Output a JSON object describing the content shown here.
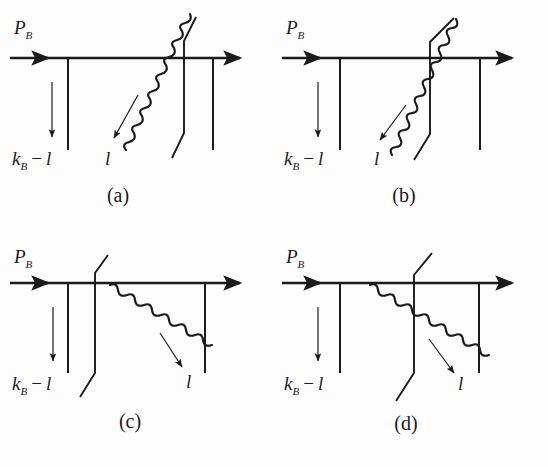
{
  "figure": {
    "type": "feynman-diagram-set",
    "background_color": "#fdfdfd",
    "ink_color": "#1b1b1b",
    "panel_count": 4
  },
  "labels": {
    "incoming_momentum": "P",
    "incoming_momentum_sub": "B",
    "spectator_momentum": "k",
    "spectator_momentum_sub": "B",
    "spectator_minus": "−",
    "gluon_momentum": "l",
    "spectator_tail": "l"
  },
  "panels": [
    {
      "id": "a",
      "tag": "(a)",
      "gluon_direction": "up-right",
      "gluon_arrow_direction": "down-left",
      "gluon_label": "l",
      "gluon_label_position": "bottom-left",
      "cut_line_position": "right",
      "gluon_crosses_cut": false
    },
    {
      "id": "b",
      "tag": "(b)",
      "gluon_direction": "up-right",
      "gluon_arrow_direction": "down-left",
      "gluon_label": "l",
      "gluon_label_position": "bottom-left",
      "cut_line_position": "middle",
      "gluon_crosses_cut": true
    },
    {
      "id": "c",
      "tag": "(c)",
      "gluon_direction": "down-right",
      "gluon_arrow_direction": "down-right",
      "gluon_label": "l",
      "gluon_label_position": "bottom-right",
      "cut_line_position": "left",
      "gluon_crosses_cut": false
    },
    {
      "id": "d",
      "tag": "(d)",
      "gluon_direction": "down-right",
      "gluon_arrow_direction": "down-right",
      "gluon_label": "l",
      "gluon_label_position": "bottom-right",
      "cut_line_position": "middle",
      "gluon_crosses_cut": true
    }
  ]
}
